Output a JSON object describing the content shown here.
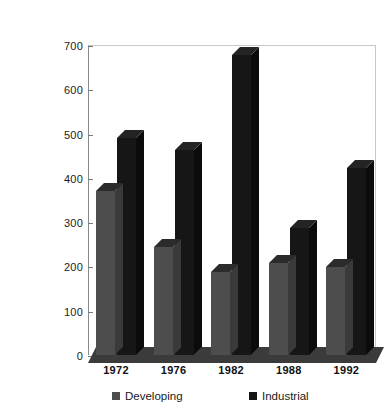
{
  "chart_data": {
    "type": "bar",
    "title": "",
    "subtitle": "",
    "xlabel": "",
    "ylabel": "",
    "categories": [
      "1972",
      "1976",
      "1982",
      "1988",
      "1992"
    ],
    "series": [
      {
        "name": "Developing",
        "color": "#4d4d4d",
        "values": [
          370,
          245,
          188,
          208,
          199
        ]
      },
      {
        "name": "Industrial",
        "color": "#161616",
        "values": [
          490,
          462,
          677,
          287,
          422
        ]
      }
    ],
    "ylim": [
      0,
      700
    ],
    "ytick_step": 100,
    "ytick_labels": [
      "0",
      "100",
      "200",
      "300",
      "400",
      "500",
      "600",
      "700"
    ],
    "grid": false,
    "legend_position": "bottom",
    "style": "3d-column"
  },
  "legend": {
    "entries": [
      {
        "label": "Developing",
        "swatch": "#4d4d4d"
      },
      {
        "label": "Industrial",
        "swatch": "#161616"
      }
    ]
  }
}
